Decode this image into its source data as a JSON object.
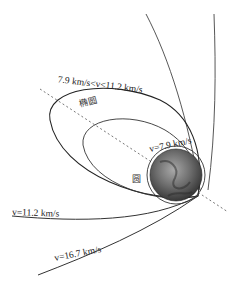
{
  "diagram": {
    "title": "",
    "labels": {
      "ellipse_range": "7.9 km/s<v<11.2 km/s",
      "ellipse_name": "椭圆",
      "circle_speed": "v=7.9 km/s",
      "circle_name": "圆",
      "escape_speed": "v=11.2 km/s",
      "solar_escape_speed": "v=16.7 km/s"
    },
    "nodes": [
      {
        "id": "earth",
        "label": "Earth (globe)"
      },
      {
        "id": "circular-orbit",
        "label": "圆"
      },
      {
        "id": "inner-ellipse",
        "label": "椭圆"
      },
      {
        "id": "outer-ellipse",
        "label": "7.9 km/s<v<11.2 km/s"
      },
      {
        "id": "parabolic-trajectory",
        "label": "v=11.2 km/s"
      },
      {
        "id": "hyperbolic-trajectory",
        "label": "v=16.7 km/s"
      },
      {
        "id": "major-axis",
        "label": "dashed axis"
      }
    ],
    "colors": {
      "line": "#333333",
      "earth_dark": "#3a3a3a",
      "earth_light": "#9a9a9a",
      "axis": "#666666"
    }
  }
}
